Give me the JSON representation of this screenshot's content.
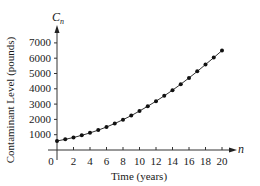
{
  "chart_data": {
    "type": "line",
    "title": "",
    "xlabel": "Time (years)",
    "ylabel": "Contaminant Level (pounds)",
    "x_axis_var": "n",
    "y_axis_var": "C",
    "y_axis_var_sub": "n",
    "x_ticks": [
      0,
      2,
      4,
      6,
      8,
      10,
      12,
      14,
      16,
      18,
      20
    ],
    "y_ticks": [
      1000,
      2000,
      3000,
      4000,
      5000,
      6000,
      7000
    ],
    "xlim": [
      0,
      21
    ],
    "ylim": [
      0,
      7500
    ],
    "grid": false,
    "legend": null,
    "markers": true,
    "x": [
      0,
      1,
      2,
      3,
      4,
      5,
      6,
      7,
      8,
      9,
      10,
      11,
      12,
      13,
      14,
      15,
      16,
      17,
      18,
      19,
      20
    ],
    "series": [
      {
        "name": "C_n",
        "values": [
          590,
          700,
          820,
          960,
          1120,
          1300,
          1500,
          1730,
          1980,
          2250,
          2550,
          2860,
          3190,
          3540,
          3910,
          4300,
          4710,
          5140,
          5590,
          6040,
          6500
        ]
      }
    ]
  }
}
